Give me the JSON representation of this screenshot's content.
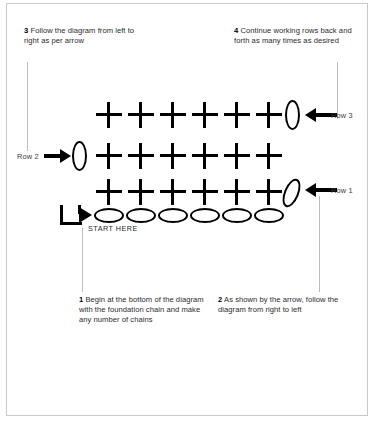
{
  "diagram": {
    "colors": {
      "stitch": "#000000",
      "leader_line": "#bdbdbd",
      "border": "#c9c9c9",
      "text": "#2b2b2b",
      "background": "#ffffff"
    },
    "rows": [
      {
        "id": "row-3",
        "label": "Row 3",
        "stitch_count": 6,
        "stitch_symbol": "cross",
        "turning_chain": "oval-vertical",
        "turning_chain_side": "right",
        "arrow_direction": "left"
      },
      {
        "id": "row-2",
        "label": "Row 2",
        "stitch_count": 6,
        "stitch_symbol": "cross",
        "turning_chain": "oval-vertical",
        "turning_chain_side": "left",
        "arrow_direction": "right"
      },
      {
        "id": "row-1",
        "label": "Row 1",
        "stitch_count": 6,
        "stitch_symbol": "cross",
        "turning_chain": "oval-slanted",
        "turning_chain_side": "right",
        "arrow_direction": "left"
      }
    ],
    "foundation_chain": {
      "id": "foundation-chain",
      "chain_count": 6,
      "symbol": "oval-horizontal"
    },
    "start_marker": {
      "label": "START HERE",
      "icon": "bent-arrow-icon"
    }
  },
  "notes": [
    {
      "id": "note-1",
      "number": "1",
      "text": " Begin at the bottom of the diagram with the foundation chain and make any number of chains"
    },
    {
      "id": "note-2",
      "number": "2",
      "text": " As shown by the arrow, follow the diagram from right to left"
    },
    {
      "id": "note-3",
      "number": "3",
      "text": " Follow the diagram from left to right as per arrow"
    },
    {
      "id": "note-4",
      "number": "4",
      "text": " Continue working rows back and forth as many times as desired"
    }
  ]
}
